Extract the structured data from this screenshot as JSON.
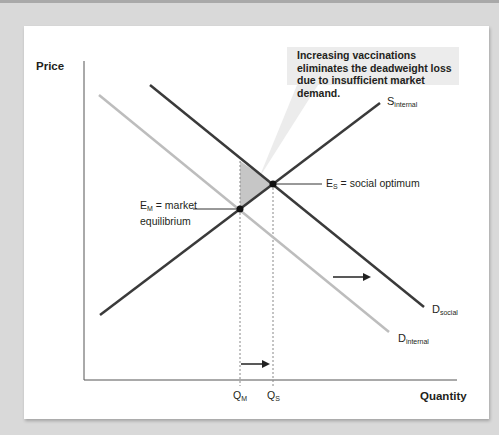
{
  "diagram": {
    "y_axis_label": "Price",
    "x_axis_label": "Quantity",
    "callout": "Increasing vaccinations eliminates the deadweight loss due to insufficient market demand.",
    "curves": {
      "supply": {
        "main": "S",
        "sub": "internal"
      },
      "demand_social": {
        "main": "D",
        "sub": "social"
      },
      "demand_internal": {
        "main": "D",
        "sub": "internal"
      }
    },
    "points": {
      "market_eq": {
        "main": "E",
        "sub": "M",
        "text": " = market",
        "line2": "equilibrium"
      },
      "social_opt": {
        "main": "E",
        "sub": "S",
        "text": " = social optimum"
      }
    },
    "ticks": {
      "qm": {
        "main": "Q",
        "sub": "M"
      },
      "qs": {
        "main": "Q",
        "sub": "S"
      }
    },
    "colors": {
      "dark_line": "#3a3a3a",
      "light_line": "#bdbdbd",
      "deadweight_fill": "#c6c6c6",
      "callout_bg": "#ececec",
      "background": "#d9d9d9"
    }
  }
}
